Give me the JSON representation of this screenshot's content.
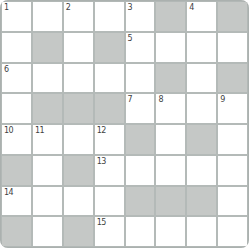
{
  "app": {
    "name": "crossword-puzzle-grid"
  },
  "colors": {
    "line": "#b4bab8",
    "block": "#c5c8c6",
    "cell": "#ffffff",
    "number": "#3f3f3f",
    "background": "#ffffff"
  },
  "grid": {
    "rows": 8,
    "cols": 8,
    "legend": {
      "O": "open-cell",
      "#": "blocked-cell"
    },
    "layout": [
      "OOOOO#O#",
      "O#O#OOOO",
      "OOOOO#O#",
      "O###OOOO",
      "OOOO#O#O",
      "#O#OOOOO",
      "OOOO###O",
      "#O#OOOOO"
    ],
    "numbers": {
      "0-0": "1",
      "0-2": "2",
      "0-4": "3",
      "0-6": "4",
      "1-4": "5",
      "2-0": "6",
      "3-4": "7",
      "3-5": "8",
      "3-7": "9",
      "4-0": "10",
      "4-1": "11",
      "4-3": "12",
      "5-3": "13",
      "6-0": "14",
      "7-3": "15"
    },
    "cell_values": {}
  }
}
